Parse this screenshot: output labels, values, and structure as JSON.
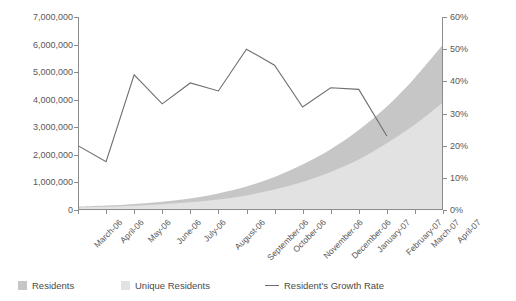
{
  "chart_data": {
    "type": "area",
    "title": "",
    "xlabel": "",
    "ylabel": "",
    "grid": false,
    "legend_position": "bottom-left",
    "categories": [
      "March-06",
      "April-06",
      "May-06",
      "June-06",
      "July-06",
      "August-06",
      "September-06",
      "October-06",
      "November-06",
      "December-06",
      "January-07",
      "February-07",
      "March-07",
      "April-07"
    ],
    "axes": {
      "left": {
        "label": "",
        "min": 0,
        "max": 7000000,
        "step": 1000000,
        "ticks": [
          "0",
          "1,000,000",
          "2,000,000",
          "3,000,000",
          "4,000,000",
          "5,000,000",
          "6,000,000",
          "7,000,000"
        ],
        "tick_values": [
          0,
          1000000,
          2000000,
          3000000,
          4000000,
          5000000,
          6000000,
          7000000
        ]
      },
      "right": {
        "label": "",
        "min": 0,
        "max": 60,
        "step": 10,
        "ticks": [
          "0%",
          "10%",
          "20%",
          "30%",
          "40%",
          "50%",
          "60%"
        ],
        "tick_values": [
          0,
          10,
          20,
          30,
          40,
          50,
          60
        ]
      }
    },
    "series": [
      {
        "name": "Residents",
        "kind": "area",
        "axis": "left",
        "color": "#c6c6c6",
        "values": [
          120000,
          160000,
          220000,
          300000,
          420000,
          600000,
          850000,
          1200000,
          1650000,
          2200000,
          2900000,
          3750000,
          4800000,
          6000000
        ]
      },
      {
        "name": "Unique Residents",
        "kind": "area",
        "axis": "left",
        "color": "#e2e2e2",
        "values": [
          90000,
          115000,
          155000,
          205000,
          280000,
          380000,
          530000,
          740000,
          1020000,
          1380000,
          1830000,
          2420000,
          3100000,
          3900000
        ]
      },
      {
        "name": "Resident's Growth Rate",
        "kind": "line",
        "axis": "right",
        "color": "#6e6e70",
        "values": [
          20.0,
          15.0,
          42.0,
          33.0,
          39.5,
          37.0,
          50.0,
          45.0,
          32.0,
          38.0,
          37.5,
          23.0,
          null,
          null
        ]
      }
    ]
  },
  "legend": {
    "items": [
      {
        "label": "Residents",
        "marker": "square",
        "color": "#c6c6c6"
      },
      {
        "label": "Unique Residents",
        "marker": "square",
        "color": "#e2e2e2"
      },
      {
        "label": "Resident's Growth Rate",
        "marker": "line",
        "color": "#6e6e70"
      }
    ]
  }
}
